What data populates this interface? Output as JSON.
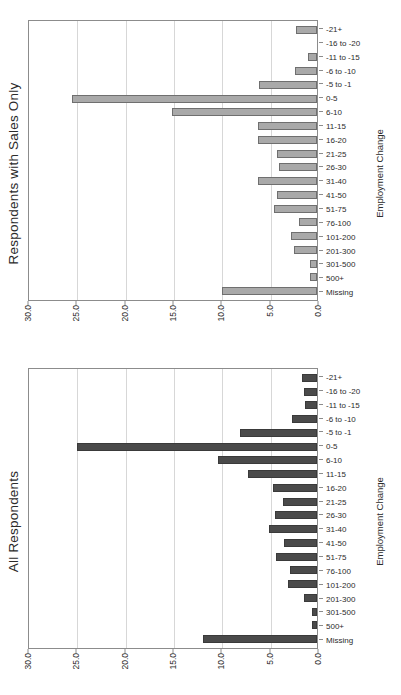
{
  "figure": {
    "axis_title_x": "Employment Change",
    "axis_title_y": "Percent"
  },
  "chart_data": [
    {
      "type": "bar",
      "title": "Respondents with Sales Only",
      "xlabel": "Employment Change",
      "ylabel": "Percent",
      "ylim": [
        0,
        30
      ],
      "yticks": [
        "0.0",
        "5.0",
        "10.0",
        "15.0",
        "20.0",
        "25.0",
        "30.0"
      ],
      "grid": true,
      "legend": "none",
      "bar_color": "#a9a9a9",
      "categories": [
        "Missing",
        "500+",
        "301-500",
        "201-300",
        "101-200",
        "76-100",
        "51-75",
        "41-50",
        "31-40",
        "26-30",
        "21-25",
        "16-20",
        "11-15",
        "6-10",
        "0-5",
        "-5 to -1",
        "-6 to -10",
        "-11 to -15",
        "-16 to -20",
        "-21+"
      ],
      "values": [
        9.8,
        0.7,
        0.7,
        2.4,
        2.7,
        1.9,
        4.4,
        4.1,
        6.1,
        3.9,
        4.1,
        6.1,
        6.1,
        15.0,
        25.3,
        6.0,
        2.3,
        0.9,
        0.0,
        2.2
      ]
    },
    {
      "type": "bar",
      "title": "All Respondents",
      "xlabel": "Employment Change",
      "ylabel": "Percent",
      "ylim": [
        0,
        30
      ],
      "yticks": [
        "0.0",
        "5.0",
        "10.0",
        "15.0",
        "20.0",
        "25.0",
        "30.0"
      ],
      "grid": true,
      "legend": "none",
      "bar_color": "#4a4a4a",
      "categories": [
        "Missing",
        "500+",
        "301-500",
        "201-300",
        "101-200",
        "76-100",
        "51-75",
        "41-50",
        "31-40",
        "26-30",
        "21-25",
        "16-20",
        "11-15",
        "6-10",
        "0-5",
        "-5 to -1",
        "-6 to -10",
        "-11 to -15",
        "-16 to -20",
        "-21+"
      ],
      "values": [
        11.8,
        0.5,
        0.5,
        1.3,
        3.0,
        2.8,
        4.2,
        3.4,
        5.0,
        4.3,
        3.5,
        4.6,
        7.1,
        10.2,
        24.8,
        8.0,
        2.6,
        1.2,
        1.3,
        1.6
      ]
    }
  ]
}
